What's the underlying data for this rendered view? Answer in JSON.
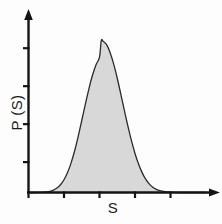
{
  "chart_data": {
    "type": "area",
    "title": "",
    "subtitle": "",
    "xlabel": "S",
    "ylabel": "P (S)",
    "legend": [],
    "annotations": [],
    "grid": false,
    "legend_position": "none",
    "xlim": [
      0,
      10
    ],
    "ylim": [
      0,
      1.05
    ],
    "x_ticks": [
      0,
      2,
      4,
      6,
      8
    ],
    "x_tick_labels": [
      "",
      "",
      "",
      "",
      ""
    ],
    "y_ticks": [
      0.2,
      0.45,
      0.7,
      0.95
    ],
    "y_tick_labels": [
      "",
      "",
      "",
      ""
    ],
    "series_name": "P(S)",
    "distribution": "gaussian",
    "peak_x": 4.1,
    "peak_y": 1.0,
    "sigma": 0.95,
    "x": [
      0.0,
      0.2,
      0.4,
      0.6,
      0.8,
      1.0,
      1.2,
      1.4,
      1.6,
      1.8,
      2.0,
      2.2,
      2.4,
      2.6,
      2.8,
      3.0,
      3.2,
      3.4,
      3.6,
      3.8,
      4.0,
      4.1,
      4.2,
      4.4,
      4.6,
      4.8,
      5.0,
      5.2,
      5.4,
      5.6,
      5.8,
      6.0,
      6.2,
      6.4,
      6.6,
      6.8,
      7.0,
      7.2,
      7.4,
      7.6,
      7.8,
      8.0,
      8.5,
      9.0,
      9.5,
      10.0
    ],
    "values": [
      0.0,
      0.0,
      0.0,
      0.001,
      0.002,
      0.004,
      0.008,
      0.016,
      0.029,
      0.051,
      0.084,
      0.131,
      0.195,
      0.275,
      0.37,
      0.474,
      0.58,
      0.681,
      0.77,
      0.84,
      0.891,
      1.0,
      0.996,
      0.973,
      0.92,
      0.845,
      0.752,
      0.648,
      0.541,
      0.437,
      0.341,
      0.257,
      0.187,
      0.131,
      0.088,
      0.057,
      0.035,
      0.021,
      0.012,
      0.007,
      0.004,
      0.002,
      0.0,
      0.0,
      0.0,
      0.0
    ]
  },
  "style": {
    "fill_color": "#d8d8d8",
    "line_color": "#2a2a2a",
    "axis_color": "#141414",
    "background_color": "#fdfdfd",
    "text_color": "#1b1b1b"
  },
  "axes": {
    "y_axis_name": "probability-density-axis",
    "x_axis_name": "s-variable-axis",
    "y_arrow": true,
    "x_arrow": true
  }
}
